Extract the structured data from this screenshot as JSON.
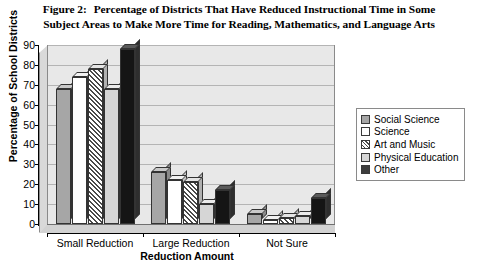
{
  "title": {
    "figure_label": "Figure 2:",
    "line1": "Percentage of Districts That Have Reduced Instructional Time in Some",
    "line2": "Subject Areas to Make More Time for Reading, Mathematics, and Language Arts"
  },
  "chart_data": {
    "type": "bar",
    "xlabel": "Reduction Amount",
    "ylabel": "Percentage of School Districts",
    "ylim": [
      0,
      90
    ],
    "yticks": [
      0,
      10,
      20,
      30,
      40,
      50,
      60,
      70,
      80,
      90
    ],
    "grid": true,
    "legend_position": "right",
    "categories": [
      "Small Reduction",
      "Large Reduction",
      "Not Sure"
    ],
    "series": [
      {
        "name": "Social Science",
        "values": [
          68,
          26,
          5
        ],
        "fill": "#a6a6a6"
      },
      {
        "name": "Science",
        "values": [
          74,
          22,
          2
        ],
        "fill": "#ffffff"
      },
      {
        "name": "Art and Music",
        "values": [
          78,
          21,
          3
        ],
        "fill": "diagonal-hatch"
      },
      {
        "name": "Physical Education",
        "values": [
          68,
          10,
          4
        ],
        "fill": "#d6d6d6"
      },
      {
        "name": "Other",
        "values": [
          88,
          17,
          13
        ],
        "fill": "#151515"
      }
    ]
  },
  "legend": {
    "items": [
      {
        "label": "Social Science"
      },
      {
        "label": "Science"
      },
      {
        "label": "Art and Music"
      },
      {
        "label": "Physical Education"
      },
      {
        "label": "Other"
      }
    ]
  }
}
